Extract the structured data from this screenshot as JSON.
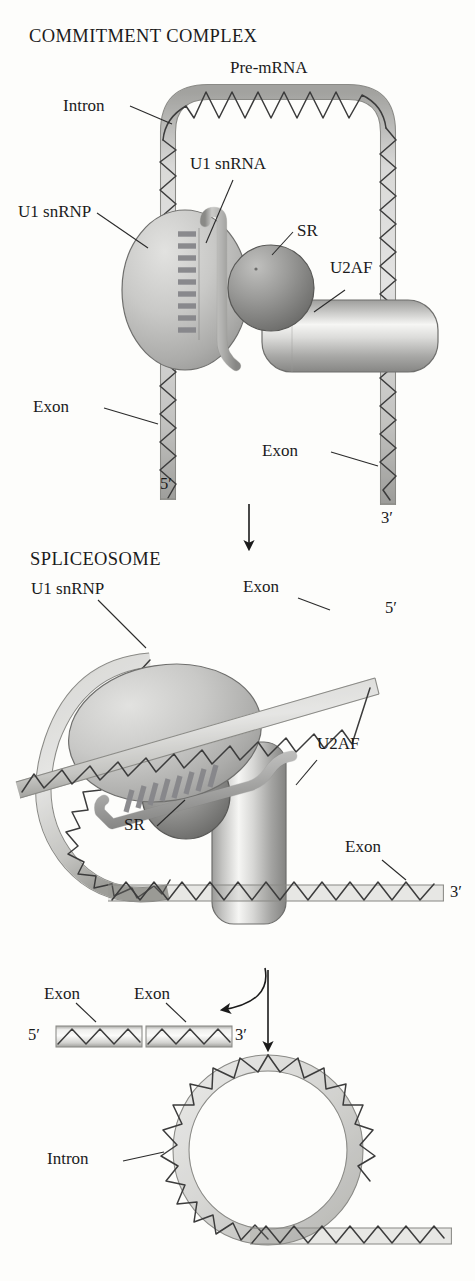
{
  "figure": {
    "background_color": "#fdfdfb",
    "ink_color": "#1b1b1b"
  },
  "palette": {
    "rna_tube_light": "#f4f4f2",
    "rna_tube_mid": "#d9d9d6",
    "rna_tube_edge": "#9a9a96",
    "wave_stroke": "#3c3c3c",
    "snrnp_light": "#d8d8d6",
    "snrnp_mid": "#b4b4b2",
    "snrnp_dark": "#8e8e8c",
    "sr_light": "#b8b8b6",
    "sr_dark": "#6e6e6c",
    "u2af_light": "#f2f2f0",
    "u2af_mid": "#c8c8c6",
    "u2af_dark": "#8a8a88",
    "snrna_light": "#eaeae8",
    "snrna_dark": "#9c9c9a"
  },
  "stages": {
    "commitment": {
      "title": "COMMITMENT COMPLEX",
      "labels": {
        "premrna": "Pre-mRNA",
        "intron": "Intron",
        "u1_snrnp": "U1 snRNP",
        "u1_snrna": "U1 snRNA",
        "sr": "SR",
        "u2af": "U2AF",
        "exon_left": "Exon",
        "exon_right": "Exon",
        "five_prime": "5′",
        "three_prime": "3′"
      }
    },
    "spliceosome": {
      "title": "SPLICEOSOME",
      "labels": {
        "u1_snrnp": "U1 snRNP",
        "exon_top": "Exon",
        "exon_bottom": "Exon",
        "sr": "SR",
        "u2af": "U2AF",
        "five_prime": "5′",
        "three_prime": "3′"
      }
    },
    "products": {
      "labels": {
        "exon_left": "Exon",
        "exon_right": "Exon",
        "five_prime": "5′",
        "three_prime": "3′"
      }
    },
    "lariat": {
      "labels": {
        "intron": "Intron"
      }
    }
  },
  "arrows": [
    {
      "name": "commitment-to-spliceosome",
      "type": "straight-down"
    },
    {
      "name": "spliceosome-to-products",
      "type": "curved-left"
    },
    {
      "name": "spliceosome-to-lariat",
      "type": "straight-down"
    }
  ]
}
